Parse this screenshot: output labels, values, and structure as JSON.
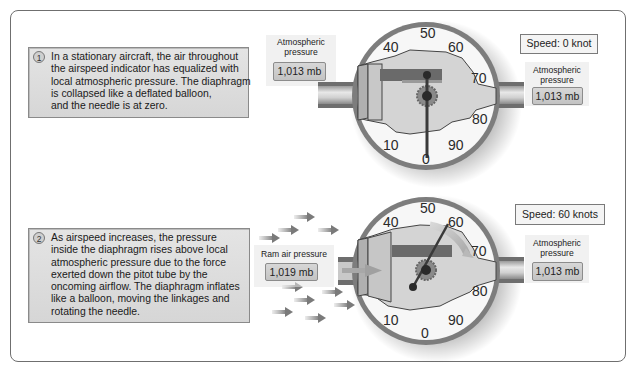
{
  "panels": [
    {
      "step_number": "1",
      "description_lines": [
        "In a stationary aircraft, the air throughout",
        "the airspeed indicator has equalized with",
        "local atmospheric pressure. The diaphragm",
        "is collapsed like a deflated balloon,",
        "and the needle is at zero."
      ],
      "left_label": "Atmospheric pressure",
      "left_label_lines": [
        "Atmospheric",
        "pressure"
      ],
      "left_value": "1,013 mb",
      "right_label_lines": [
        "Atmospheric",
        "pressure"
      ],
      "right_value": "1,013 mb",
      "speed": "Speed: 0 knot",
      "needle_reading": 0,
      "airflow_arrows": false
    },
    {
      "step_number": "2",
      "description_lines": [
        "As airspeed increases, the pressure",
        "inside the diaphragm rises above local",
        "atmospheric pressure due to the force",
        "exerted down the pitot tube by the",
        "oncoming airflow. The diaphragm inflates",
        "like a balloon, moving the linkages and",
        "rotating the needle."
      ],
      "left_label": "Ram air pressure",
      "left_label_lines": [
        "Ram air pressure"
      ],
      "left_value": "1,019 mb",
      "right_label_lines": [
        "Atmospheric",
        "pressure"
      ],
      "right_value": "1,013 mb",
      "speed": "Speed: 60 knots",
      "needle_reading": 60,
      "airflow_arrows": true
    }
  ],
  "gauge": {
    "dial_numbers": [
      "0",
      "10",
      "40",
      "50",
      "60",
      "70",
      "80",
      "90"
    ],
    "colors": {
      "bezel": "#7d7d7d",
      "face": "#f7f7f7",
      "diaphragm": "#d4d4d4",
      "linkage_bar": "#6a6a6a",
      "needle": "#3a3a3a",
      "tube": "#cfcfcf",
      "arrows": "#8a8a8a"
    }
  }
}
